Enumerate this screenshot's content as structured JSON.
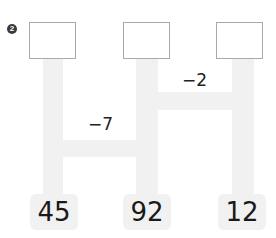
{
  "problem": {
    "number_badge": "2"
  },
  "answer_boxes": [
    {
      "value": ""
    },
    {
      "value": ""
    },
    {
      "value": ""
    }
  ],
  "start_values": [
    "45",
    "92",
    "12"
  ],
  "operations": [
    {
      "label": "−2",
      "between": "middle-right",
      "position": "upper"
    },
    {
      "label": "−7",
      "between": "left-middle",
      "position": "lower"
    }
  ],
  "colors": {
    "band": "#f1f1f1",
    "box_border": "#a9a9a9",
    "badge": "#3a3a3a",
    "text": "#1a1a1a"
  }
}
